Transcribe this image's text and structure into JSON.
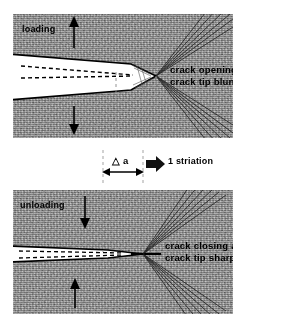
{
  "figure": {
    "background_color": "#ffffff",
    "material_color": "#9a9a9a",
    "line_color": "#000000"
  },
  "panels": [
    {
      "id": "loading",
      "stage_label": "loading",
      "stage_arrow_icon": "arrow-up-icon",
      "lower_arrow_icon": "arrow-down-icon",
      "description_line1": "crack opening and",
      "description_line2": "crack tip blunting",
      "crack_state": "open-blunted"
    },
    {
      "id": "unloading",
      "stage_label": "unloading",
      "stage_arrow_icon": "arrow-down-icon",
      "lower_arrow_icon": "arrow-up-icon",
      "description_line1": "crack closing and",
      "description_line2": "crack tip sharpening",
      "crack_state": "closed-sharpened"
    }
  ],
  "annotation": {
    "delta_symbol": "△",
    "delta_quantity": "a",
    "delta_full": "△ a",
    "implies_icon": "block-arrow-right-icon",
    "result_text": "1 striation",
    "dimension_arrow_icon": "double-headed-arrow-icon",
    "guide_line_style": "dashed"
  }
}
